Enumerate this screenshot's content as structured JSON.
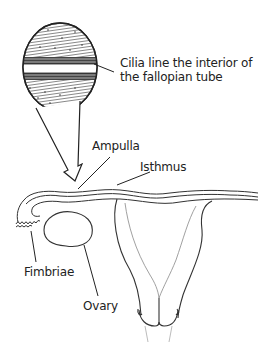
{
  "diagram": {
    "type": "anatomical-illustration",
    "colors": {
      "stroke": "#333333",
      "text": "#222222",
      "background": "#ffffff"
    },
    "labels": {
      "cilia": "Cilia line the interior of the fallopian tube",
      "ampulla": "Ampulla",
      "isthmus": "Isthmus",
      "fimbriae": "Fimbriae",
      "ovary": "Ovary"
    },
    "elements": [
      {
        "name": "magnified-circle",
        "description": "Cross-section showing cilia lining the tube interior"
      },
      {
        "name": "magnification-arrow",
        "description": "Arrow pointing from circle to fallopian tube"
      },
      {
        "name": "fallopian-tube",
        "description": "Tube extending from uterus to fimbriae"
      },
      {
        "name": "ovary",
        "description": "Oval ovary below fallopian tube"
      },
      {
        "name": "uterus",
        "description": "Uterus outline with cervix"
      }
    ]
  }
}
